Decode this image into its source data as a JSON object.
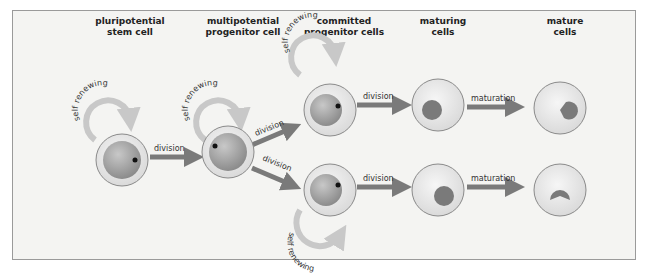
{
  "stages": [
    {
      "id": "pluripotential",
      "line1": "pluripotential",
      "line2": "stem cell"
    },
    {
      "id": "multipotential",
      "line1": "multipotential",
      "line2": "progenitor cell"
    },
    {
      "id": "committed",
      "line1": "committed",
      "line2": "progenitor cells"
    },
    {
      "id": "maturing",
      "line1": "maturing",
      "line2": "cells"
    },
    {
      "id": "mature",
      "line1": "mature",
      "line2": "cells"
    }
  ],
  "labels": {
    "self_renewing": "self renewing",
    "division": "division",
    "maturation": "maturation"
  },
  "colors": {
    "arrow": "#7a7a7a",
    "cell_outer": "#ececec",
    "cell_border": "#8a8a8a",
    "nucleus": "#808080",
    "panel_bg": "#f4f4f2"
  }
}
